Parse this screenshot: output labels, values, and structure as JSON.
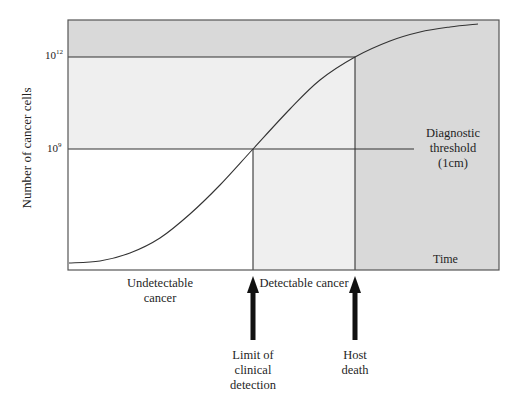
{
  "chart_data": {
    "type": "line",
    "title": "",
    "xlabel": "Time",
    "ylabel": "Number of cancer cells",
    "y_scale": "log",
    "y_ticks": [
      {
        "base": "10",
        "exp": "9",
        "label": "10^9"
      },
      {
        "base": "10",
        "exp": "12",
        "label": "10^12"
      }
    ],
    "series": [
      {
        "name": "Tumour growth (Gompertzian)",
        "points_px": [
          [
            69,
            263
          ],
          [
            100,
            261
          ],
          [
            130,
            253
          ],
          [
            160,
            238
          ],
          [
            190,
            214
          ],
          [
            220,
            185
          ],
          [
            253,
            149
          ],
          [
            290,
            109
          ],
          [
            320,
            80
          ],
          [
            355,
            57
          ],
          [
            390,
            41
          ],
          [
            420,
            32
          ],
          [
            450,
            27
          ],
          [
            478,
            24
          ]
        ]
      }
    ],
    "annotations": {
      "diagnostic_threshold": "Diagnostic threshold (1cm)",
      "threshold_value": "10^9",
      "lethal_level": "10^12",
      "phases": [
        "Undetectable cancer",
        "Detectable cancer"
      ],
      "events": [
        "Limit of clinical detection",
        "Host death"
      ]
    },
    "grid": false,
    "legend": "none"
  },
  "figure": {
    "frame": {
      "x0": 68,
      "y0": 20,
      "x1": 499,
      "y1": 270
    },
    "y12": 57,
    "y9": 149,
    "x_detect": 253,
    "x_death": 355,
    "threshold_line_end": 414,
    "colors": {
      "dark_shade": "#d9d9d9",
      "light_shade": "#efefef",
      "line": "#333333",
      "arrow": "#111111"
    }
  },
  "labels": {
    "ylabel": "Number of cancer cells",
    "tick_12_base": "10",
    "tick_12_exp": "12",
    "tick_9_base": "10",
    "tick_9_exp": "9",
    "time": "Time",
    "threshold": [
      "Diagnostic",
      "threshold",
      "(1cm)"
    ],
    "undetectable": [
      "Undetectable",
      "cancer"
    ],
    "detectable": "Detectable cancer",
    "limit": [
      "Limit of",
      "clinical",
      "detection"
    ],
    "death": [
      "Host",
      "death"
    ]
  }
}
